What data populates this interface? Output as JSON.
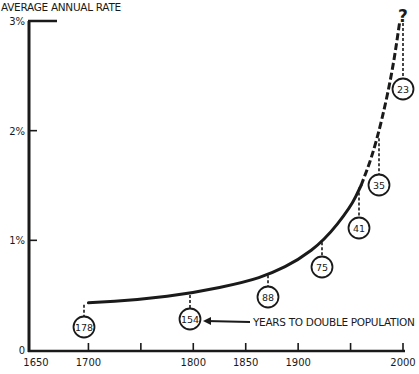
{
  "chart_data": {
    "type": "line",
    "title": "",
    "ylabel": "AVERAGE ANNUAL RATE",
    "xlabel": "",
    "ylim": [
      0,
      3
    ],
    "xlim": [
      1650,
      2000
    ],
    "y_ticks": [
      {
        "value": 0,
        "label": "0"
      },
      {
        "value": 1,
        "label": "1%"
      },
      {
        "value": 2,
        "label": "2%"
      },
      {
        "value": 3,
        "label": "3%"
      }
    ],
    "x_ticks": [
      {
        "value": 1650,
        "label": "1650"
      },
      {
        "value": 1700,
        "label": "1700"
      },
      {
        "value": 1750,
        "label": ""
      },
      {
        "value": 1800,
        "label": "1800"
      },
      {
        "value": 1850,
        "label": "1850"
      },
      {
        "value": 1900,
        "label": "1900"
      },
      {
        "value": 1950,
        "label": ""
      },
      {
        "value": 2000,
        "label": "2000"
      }
    ],
    "grid": false,
    "series": [
      {
        "name": "Average annual growth rate (%)",
        "x": [
          1700,
          1750,
          1800,
          1850,
          1875,
          1900,
          1925,
          1950,
          1960,
          1970,
          1980,
          1990,
          1997
        ],
        "values": [
          0.43,
          0.46,
          0.52,
          0.62,
          0.7,
          0.82,
          1.0,
          1.3,
          1.5,
          1.75,
          2.1,
          2.55,
          3.0
        ],
        "solid_until": 1960,
        "dashed_from": 1960
      }
    ],
    "annotations": [
      {
        "x": 1700,
        "rate": 0.43,
        "years_to_double": "178"
      },
      {
        "x": 1800,
        "rate": 0.52,
        "years_to_double": "154"
      },
      {
        "x": 1875,
        "rate": 0.7,
        "years_to_double": "88"
      },
      {
        "x": 1925,
        "rate": 1.0,
        "years_to_double": "75"
      },
      {
        "x": 1960,
        "rate": 1.5,
        "years_to_double": "41"
      },
      {
        "x": 1980,
        "rate": 1.95,
        "years_to_double": "35"
      },
      {
        "x": 1997,
        "rate": 3.0,
        "years_to_double": "23"
      }
    ],
    "callout": "YEARS TO DOUBLE POPULATION",
    "end_marker": "?"
  }
}
